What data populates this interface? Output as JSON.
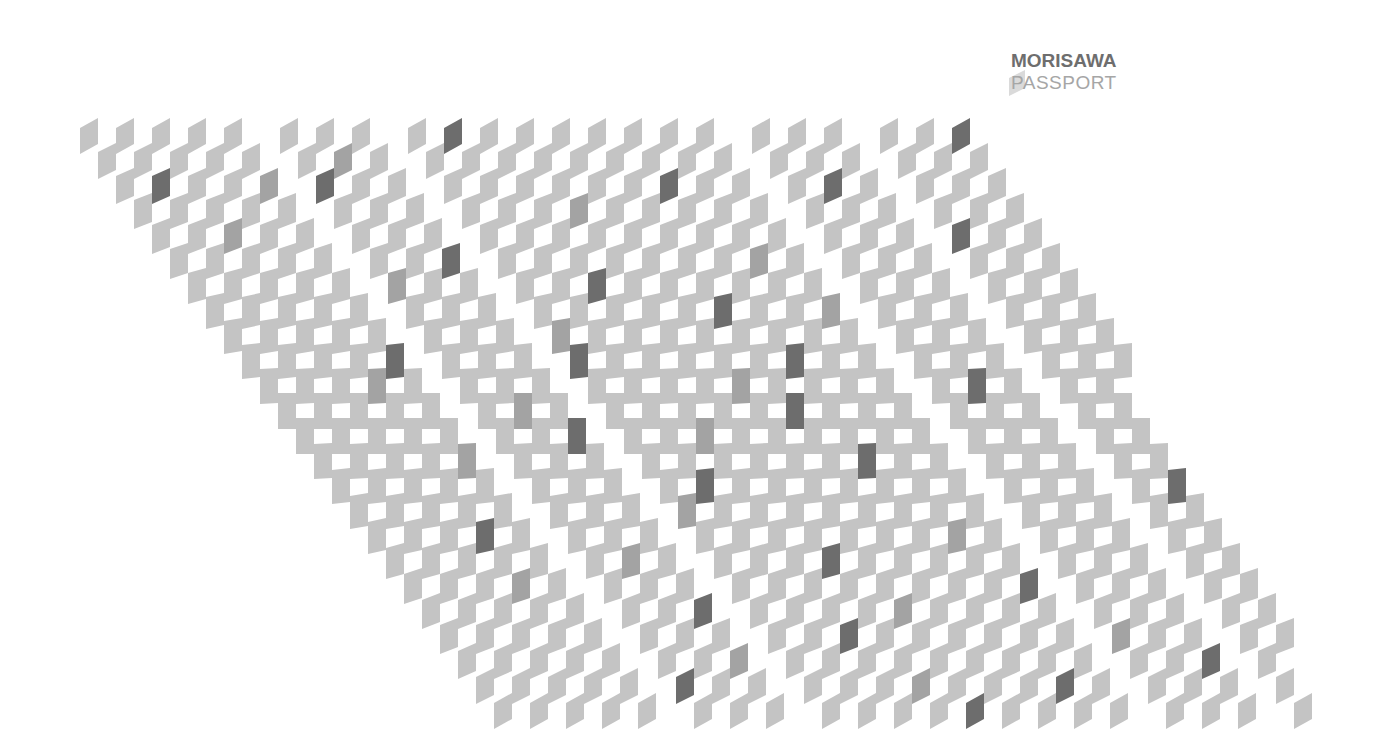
{
  "logo": {
    "line1": "MORISAWA",
    "line2": "PASSPORT"
  },
  "colors": {
    "background": "#ffffff",
    "light": "#c4c4c4",
    "medium": "#a3a3a3",
    "dark": "#6d6d6d",
    "logo_dark": "#6e6e6e",
    "logo_light": "#a6a6a6",
    "logo_mark": "#d6d6d6"
  },
  "pattern": {
    "row_count": 24,
    "origin_x": 80,
    "origin_y": 118,
    "row_pitch": 25,
    "row_shift": 18,
    "col_pitch": 36,
    "cell_width": 18,
    "cell_height": 36,
    "max_skew": 10,
    "flat_row": 11.5,
    "channels": [
      5,
      8,
      17,
      20,
      25
    ],
    "channel_width": 20,
    "right_limit_top": 1000,
    "right_limit_bottom": 1340,
    "dark_cells": [
      [
        0,
        9
      ],
      [
        0,
        22
      ],
      [
        2,
        1
      ],
      [
        2,
        5
      ],
      [
        2,
        14
      ],
      [
        2,
        18
      ],
      [
        4,
        20
      ],
      [
        5,
        7
      ],
      [
        6,
        10
      ],
      [
        7,
        13
      ],
      [
        9,
        4
      ],
      [
        9,
        8
      ],
      [
        9,
        14
      ],
      [
        10,
        18
      ],
      [
        11,
        13
      ],
      [
        12,
        7
      ],
      [
        13,
        14
      ],
      [
        14,
        9
      ],
      [
        14,
        21
      ],
      [
        16,
        3
      ],
      [
        17,
        11
      ],
      [
        18,
        16
      ],
      [
        19,
        7
      ],
      [
        20,
        10
      ],
      [
        21,
        19
      ],
      [
        22,
        5
      ],
      [
        22,
        15
      ],
      [
        23,
        12
      ]
    ],
    "medium_cells": [
      [
        1,
        6
      ],
      [
        2,
        4
      ],
      [
        3,
        11
      ],
      [
        4,
        2
      ],
      [
        5,
        15
      ],
      [
        6,
        5
      ],
      [
        7,
        16
      ],
      [
        8,
        8
      ],
      [
        10,
        3
      ],
      [
        10,
        12
      ],
      [
        11,
        6
      ],
      [
        12,
        10
      ],
      [
        13,
        4
      ],
      [
        15,
        8
      ],
      [
        16,
        15
      ],
      [
        17,
        6
      ],
      [
        18,
        3
      ],
      [
        19,
        12
      ],
      [
        20,
        17
      ],
      [
        21,
        7
      ],
      [
        22,
        11
      ]
    ]
  }
}
